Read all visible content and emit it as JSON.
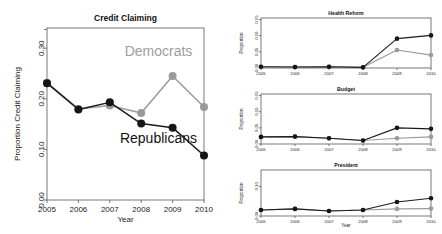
{
  "figure": {
    "background": "#ffffff",
    "colors": {
      "democrats": "#9a9a9a",
      "republicans": "#151515",
      "axis": "#555555"
    }
  },
  "chart_data": [
    {
      "id": "credit-claiming",
      "type": "line",
      "title": "Credit Claiming",
      "xlabel": "Year",
      "ylabel": "Proportion Credit Claiming",
      "x": [
        2005,
        2006,
        2007,
        2008,
        2009,
        2010
      ],
      "xticklabels": [
        "2005",
        "2006",
        "2007",
        "2008",
        "2009",
        "2010"
      ],
      "yticks": [
        0.0,
        0.1,
        0.2,
        0.3
      ],
      "yticklabels": [
        "0.00",
        "0.10",
        "0.20",
        "0.30"
      ],
      "ylim": [
        0.0,
        0.34
      ],
      "grid": false,
      "legend": "inline-annotations",
      "annotations": [
        {
          "text": "Democrats",
          "series": "Democrats",
          "x": 2008.55,
          "y": 0.285
        },
        {
          "text": "Republicans",
          "series": "Republicans",
          "x": 2008.55,
          "y": 0.113
        }
      ],
      "series": [
        {
          "name": "Democrats",
          "color": "#9a9a9a",
          "values": [
            0.232,
            0.18,
            0.187,
            0.172,
            0.245,
            0.184
          ]
        },
        {
          "name": "Republicans",
          "color": "#151515",
          "values": [
            0.231,
            0.179,
            0.193,
            0.151,
            0.143,
            0.088
          ]
        }
      ]
    },
    {
      "id": "health-reform",
      "type": "line",
      "title": "Health Reform",
      "xlabel": "",
      "ylabel": "Proportion",
      "x": [
        2005,
        2006,
        2007,
        2008,
        2009,
        2010
      ],
      "xticklabels": [
        "2005",
        "2006",
        "2007",
        "2008",
        "2009",
        "2010"
      ],
      "yticks": [
        0.0,
        0.05,
        0.1,
        0.15
      ],
      "yticklabels": [
        "0.00",
        "0.05",
        "0.10",
        "0.15"
      ],
      "ylim": [
        0.0,
        0.155
      ],
      "grid": false,
      "series": [
        {
          "name": "Democrats",
          "color": "#9a9a9a",
          "values": [
            0.004,
            0.003,
            0.004,
            0.002,
            0.056,
            0.04
          ]
        },
        {
          "name": "Republicans",
          "color": "#151515",
          "values": [
            0.004,
            0.003,
            0.004,
            0.002,
            0.091,
            0.101
          ]
        }
      ]
    },
    {
      "id": "budget",
      "type": "line",
      "title": "Budget",
      "xlabel": "",
      "ylabel": "Proportion",
      "x": [
        2005,
        2006,
        2007,
        2008,
        2009,
        2010
      ],
      "xticklabels": [
        "2005",
        "2006",
        "2007",
        "2008",
        "2009",
        "2010"
      ],
      "yticks": [
        0.0,
        0.05,
        0.1,
        0.15
      ],
      "yticklabels": [
        "0.00",
        "0.05",
        "0.10",
        "0.15"
      ],
      "ylim": [
        0.0,
        0.155
      ],
      "grid": false,
      "series": [
        {
          "name": "Democrats",
          "color": "#9a9a9a",
          "values": [
            0.022,
            0.023,
            0.018,
            0.011,
            0.018,
            0.022
          ]
        },
        {
          "name": "Republicans",
          "color": "#151515",
          "values": [
            0.022,
            0.023,
            0.018,
            0.011,
            0.05,
            0.047
          ]
        }
      ]
    },
    {
      "id": "president",
      "type": "line",
      "title": "President",
      "xlabel": "Year",
      "ylabel": "Proportion",
      "x": [
        2005,
        2006,
        2007,
        2008,
        2009,
        2010
      ],
      "xticklabels": [
        "2005",
        "2006",
        "2007",
        "2008",
        "2009",
        "2010"
      ],
      "yticks": [
        0.0,
        0.1
      ],
      "yticklabels": [
        "0.00",
        "0.10"
      ],
      "ylim": [
        0.0,
        0.155
      ],
      "grid": false,
      "series": [
        {
          "name": "Democrats",
          "color": "#9a9a9a",
          "values": [
            0.02,
            0.024,
            0.017,
            0.02,
            0.024,
            0.025
          ]
        },
        {
          "name": "Republicans",
          "color": "#151515",
          "values": [
            0.02,
            0.024,
            0.017,
            0.02,
            0.047,
            0.06
          ]
        }
      ]
    }
  ]
}
